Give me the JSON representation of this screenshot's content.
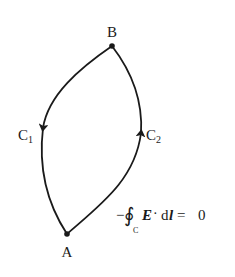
{
  "diagram": {
    "points": {
      "A": {
        "label": "A",
        "x": 67,
        "y": 234
      },
      "B": {
        "label": "B",
        "x": 112,
        "y": 46
      }
    },
    "paths": [
      {
        "name": "C1",
        "label": "C",
        "subscript": "1",
        "from": "B",
        "to": "A",
        "direction": "downward"
      },
      {
        "name": "C2",
        "label": "C",
        "subscript": "2",
        "from": "A",
        "to": "B",
        "direction": "upward"
      }
    ],
    "equation": {
      "minus": "−",
      "integral": "∮",
      "subscript": "C",
      "vector_E": "E",
      "dot": "·",
      "d": "d",
      "vector_l": "l",
      "equals": "=",
      "rhs": "0"
    },
    "stroke_color": "#1a1a1a"
  }
}
